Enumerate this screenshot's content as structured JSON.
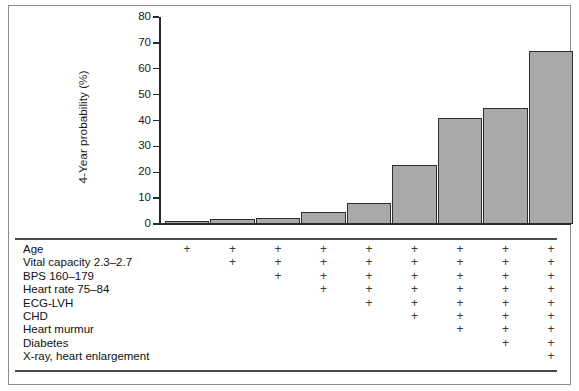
{
  "chart_data": {
    "type": "bar",
    "title": "",
    "xlabel": "",
    "ylabel": "4-Year probability (%)",
    "ylim": [
      0,
      80
    ],
    "yticks": [
      0,
      10,
      20,
      30,
      40,
      50,
      60,
      70,
      80
    ],
    "ytick_labels": [
      "0",
      "10",
      "20",
      "30",
      "40",
      "50",
      "60",
      "70",
      "80"
    ],
    "grid": false,
    "legend": "none",
    "categories": [
      "1",
      "2",
      "3",
      "4",
      "5",
      "6",
      "7",
      "8",
      "9"
    ],
    "values": [
      1,
      2,
      2.5,
      4.5,
      8,
      23,
      41,
      45,
      67
    ],
    "bar_color": "#a9a9a9",
    "bar_edge_color": "#2e2e2e",
    "risk_factors": [
      "Age",
      "Vital capacity 2.3–2.7",
      "BPS 160–179",
      "Heart rate 75–84",
      "ECG-LVH",
      "CHD",
      "Heart murmur",
      "Diabetes",
      "X-ray, heart enlargement"
    ],
    "factor_matrix": [
      [
        true,
        true,
        true,
        true,
        true,
        true,
        true,
        true,
        true
      ],
      [
        false,
        true,
        true,
        true,
        true,
        true,
        true,
        true,
        true
      ],
      [
        false,
        false,
        true,
        true,
        true,
        true,
        true,
        true,
        true
      ],
      [
        false,
        false,
        false,
        true,
        true,
        true,
        true,
        true,
        true
      ],
      [
        false,
        false,
        false,
        false,
        true,
        true,
        true,
        true,
        true
      ],
      [
        false,
        false,
        false,
        false,
        false,
        true,
        true,
        true,
        true
      ],
      [
        false,
        false,
        false,
        false,
        false,
        false,
        true,
        true,
        true
      ],
      [
        false,
        false,
        false,
        false,
        false,
        false,
        false,
        true,
        true
      ],
      [
        false,
        false,
        false,
        false,
        false,
        false,
        false,
        false,
        true
      ]
    ],
    "marker_glyph": "+"
  },
  "colors": {
    "frame": "#8c8c8c",
    "axis": "#2b2b2b",
    "rule": "#4a4a4a",
    "text": "#111111",
    "bar_fill": "#a9a9a9",
    "bar_stroke": "#2e2e2e"
  }
}
